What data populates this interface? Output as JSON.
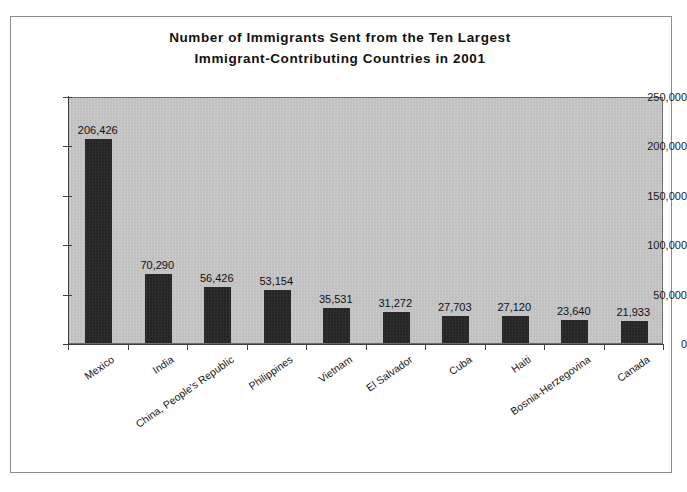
{
  "chart_data": {
    "type": "bar",
    "title": "Number of Immigrants Sent from the Ten Largest Immigrant-Contributing Countries in 2001",
    "title_line1": "Number of Immigrants Sent from the Ten Largest",
    "title_line2": "Immigrant-Contributing Countries in 2001",
    "xlabel": "",
    "ylabel": "",
    "ylim": [
      0,
      250000
    ],
    "grid": false,
    "legend": false,
    "bar_color": "#2b2b2b",
    "plot_background": "#c4c4c4",
    "categories": [
      "Mexico",
      "India",
      "China, People's Republic",
      "Philippines",
      "Vietnam",
      "El Salvador",
      "Cuba",
      "Haiti",
      "Bosnia-Herzegovina",
      "Canada"
    ],
    "values": [
      206426,
      70290,
      56426,
      53154,
      35531,
      31272,
      27703,
      27120,
      23640,
      21933
    ],
    "value_labels": [
      "206,426",
      "70,290",
      "56,426",
      "53,154",
      "35,531",
      "31,272",
      "27,703",
      "27,120",
      "23,640",
      "21,933"
    ],
    "yticks": [
      0,
      50000,
      100000,
      150000,
      200000,
      250000
    ],
    "ytick_labels": [
      "0",
      "50,000",
      "100,000",
      "150,000",
      "200,000",
      "250,000"
    ]
  }
}
